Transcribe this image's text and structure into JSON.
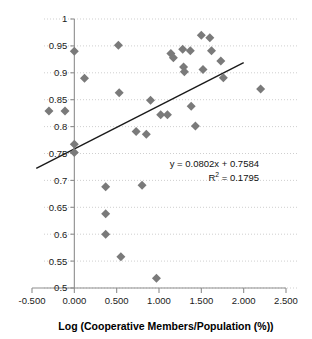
{
  "chart_data": {
    "type": "scatter",
    "title": "",
    "xlabel": "Log (Cooperative Members/Population (%))",
    "ylabel": "",
    "xlim": [
      -0.5,
      2.5
    ],
    "ylim": [
      0.5,
      1.0
    ],
    "grid": true,
    "legend": "none",
    "x_ticks": [
      "-0.500",
      "0.000",
      "0.500",
      "1.000",
      "1.500",
      "2.000",
      "2.500"
    ],
    "x_tick_values": [
      -0.5,
      0.0,
      0.5,
      1.0,
      1.5,
      2.0,
      2.5
    ],
    "y_ticks": [
      "0.5",
      "0.55",
      "0.6",
      "0.65",
      "0.7",
      "0.75",
      "0.8",
      "0.85",
      "0.9",
      "0.95",
      "1"
    ],
    "y_tick_values": [
      0.5,
      0.55,
      0.6,
      0.65,
      0.7,
      0.75,
      0.8,
      0.85,
      0.9,
      0.95,
      1.0
    ],
    "marker_color": "#7a7a7a",
    "marker_shape": "diamond",
    "marker_size": 9,
    "points": [
      {
        "x": -0.3,
        "y": 0.829
      },
      {
        "x": -0.11,
        "y": 0.829
      },
      {
        "x": 0.0,
        "y": 0.94
      },
      {
        "x": 0.0,
        "y": 0.767
      },
      {
        "x": 0.0,
        "y": 0.752
      },
      {
        "x": 0.12,
        "y": 0.89
      },
      {
        "x": 0.37,
        "y": 0.688
      },
      {
        "x": 0.37,
        "y": 0.638
      },
      {
        "x": 0.37,
        "y": 0.6
      },
      {
        "x": 0.52,
        "y": 0.951
      },
      {
        "x": 0.53,
        "y": 0.863
      },
      {
        "x": 0.55,
        "y": 0.558
      },
      {
        "x": 0.73,
        "y": 0.791
      },
      {
        "x": 0.8,
        "y": 0.691
      },
      {
        "x": 0.85,
        "y": 0.786
      },
      {
        "x": 0.9,
        "y": 0.849
      },
      {
        "x": 0.97,
        "y": 0.518
      },
      {
        "x": 1.02,
        "y": 0.822
      },
      {
        "x": 1.1,
        "y": 0.822
      },
      {
        "x": 1.14,
        "y": 0.936
      },
      {
        "x": 1.17,
        "y": 0.928
      },
      {
        "x": 1.28,
        "y": 0.944
      },
      {
        "x": 1.29,
        "y": 0.911
      },
      {
        "x": 1.3,
        "y": 0.902
      },
      {
        "x": 1.37,
        "y": 0.941
      },
      {
        "x": 1.38,
        "y": 0.838
      },
      {
        "x": 1.43,
        "y": 0.801
      },
      {
        "x": 1.5,
        "y": 0.97
      },
      {
        "x": 1.52,
        "y": 0.906
      },
      {
        "x": 1.6,
        "y": 0.965
      },
      {
        "x": 1.62,
        "y": 0.941
      },
      {
        "x": 1.73,
        "y": 0.922
      },
      {
        "x": 1.76,
        "y": 0.891
      },
      {
        "x": 2.2,
        "y": 0.87
      }
    ],
    "trendline": {
      "slope": 0.0802,
      "intercept": 0.7584,
      "x_start": -0.45,
      "x_end": 2.0,
      "color": "#1a1a1a"
    },
    "annotations": {
      "equation": "y = 0.0802x + 0.7584",
      "r_squared_prefix": "R",
      "r_squared_sup": "2",
      "r_squared_value": " = 0.1795"
    }
  }
}
